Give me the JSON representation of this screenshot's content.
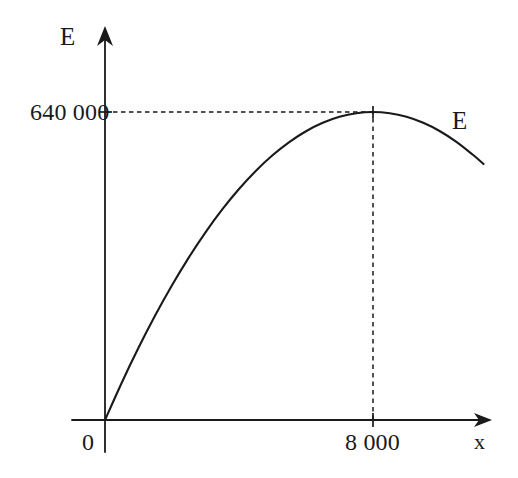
{
  "figure": {
    "background_color": "#ffffff",
    "ink_color": "#1a1a1a"
  },
  "axes": {
    "y_axis_label": "E",
    "x_axis_label": "x",
    "origin_label": "0",
    "y_tick_label": "640 000",
    "x_tick_label": "8 000"
  },
  "annotations": {
    "curve_label": "E"
  },
  "chart_data": {
    "type": "line",
    "title": "",
    "xlabel": "x",
    "ylabel": "E",
    "xlim": [
      0,
      11500
    ],
    "ylim": [
      0,
      760000
    ],
    "grid": false,
    "legend": "none",
    "axis_style": "arrow-ended axes through origin",
    "tick_labels": {
      "x": [
        "0",
        "8 000"
      ],
      "y": [
        "640 000"
      ]
    },
    "ticks": {
      "x": [
        0,
        8000
      ],
      "y": [
        640000
      ]
    },
    "series": [
      {
        "name": "E",
        "label_text": "E",
        "style": "solid",
        "equation": "E = 160x - 0.01x^2",
        "x": [
          0,
          500,
          1000,
          1500,
          2000,
          2500,
          3000,
          3500,
          4000,
          4500,
          5000,
          5500,
          6000,
          6500,
          7000,
          7500,
          8000,
          8500,
          9000,
          9500,
          10000,
          10500,
          11000,
          11300
        ],
        "values": [
          0,
          77500,
          150000,
          217500,
          280000,
          337500,
          390000,
          437500,
          480000,
          517500,
          550000,
          577500,
          600000,
          617500,
          630000,
          637500,
          640000,
          637500,
          630000,
          617500,
          600000,
          577500,
          550000,
          531900
        ]
      }
    ],
    "annotations": [
      {
        "type": "maximum-point",
        "x": 8000,
        "y": 640000,
        "x_label": "8 000",
        "y_label": "640 000",
        "guide_lines": [
          "horizontal-dashed",
          "vertical-dashed"
        ]
      }
    ]
  }
}
